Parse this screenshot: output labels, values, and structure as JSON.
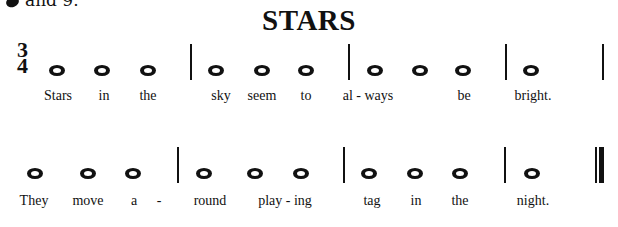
{
  "fragment_text": "and 9.",
  "title": "STARS",
  "time_signature": {
    "top": "3",
    "bottom": "4"
  },
  "lines": [
    {
      "notes_x": [
        57,
        102,
        148,
        216,
        262,
        306,
        375,
        420,
        463,
        531
      ],
      "notes_y": 70,
      "bars_x": [
        190,
        348,
        505,
        602
      ],
      "bars_y": [
        44,
        80
      ],
      "lyrics": [
        {
          "x": 58,
          "text": "Stars"
        },
        {
          "x": 104,
          "text": "in"
        },
        {
          "x": 148,
          "text": "the"
        },
        {
          "x": 221,
          "text": "sky"
        },
        {
          "x": 262,
          "text": "seem"
        },
        {
          "x": 306,
          "text": "to"
        },
        {
          "x": 368,
          "text": "al - ways"
        },
        {
          "x": 464,
          "text": "be"
        },
        {
          "x": 533,
          "text": "bright."
        }
      ],
      "lyrics_y": 96
    },
    {
      "notes_x": [
        35,
        88,
        133,
        204,
        255,
        301,
        369,
        415,
        460,
        532
      ],
      "notes_y": 173,
      "bars_x": [
        177,
        343,
        504
      ],
      "bars_y": [
        147,
        183
      ],
      "final_bar_x": 595,
      "lyrics": [
        {
          "x": 34,
          "text": "They"
        },
        {
          "x": 88,
          "text": "move"
        },
        {
          "x": 134,
          "text": "a"
        },
        {
          "x": 159,
          "text": "-"
        },
        {
          "x": 210,
          "text": "round"
        },
        {
          "x": 285,
          "text": "play - ing"
        },
        {
          "x": 372,
          "text": "tag"
        },
        {
          "x": 416,
          "text": "in"
        },
        {
          "x": 460,
          "text": "the"
        },
        {
          "x": 533,
          "text": "night."
        }
      ],
      "lyrics_y": 201
    }
  ]
}
